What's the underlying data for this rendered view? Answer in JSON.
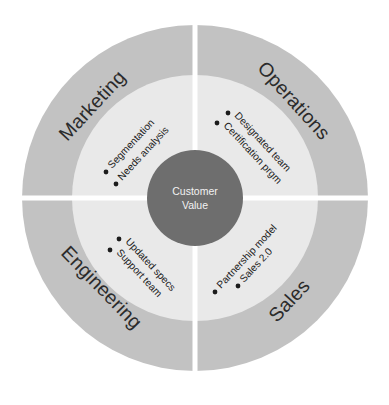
{
  "diagram": {
    "type": "concentric-quadrant-wheel",
    "center_label_line1": "Customer",
    "center_label_line2": "Value",
    "colors": {
      "background": "#ffffff",
      "outer_ring": "#c2c2c2",
      "inner_ring": "#e9e9e9",
      "hub": "#6e6e6e",
      "divider": "#ffffff",
      "label_text": "#2b2b2b",
      "hub_text": "#f2f2f2",
      "bullet_dot": "#1c1c1c"
    },
    "geometry": {
      "center_x": 195,
      "center_y": 198,
      "outer_radius": 173,
      "inner_ring_radius": 123,
      "hub_radius": 48,
      "divider_width": 5
    },
    "quadrants": [
      {
        "id": "marketing",
        "label": "Marketing",
        "position": "top-left",
        "items": [
          {
            "text": "Segmentation"
          },
          {
            "text": "Needs analysis"
          }
        ]
      },
      {
        "id": "operations",
        "label": "Operations",
        "position": "top-right",
        "items": [
          {
            "text": "Designated team"
          },
          {
            "text": "Certification prgm"
          }
        ]
      },
      {
        "id": "engineering",
        "label": "Engineering",
        "position": "bottom-left",
        "items": [
          {
            "text": "Updated specs"
          },
          {
            "text": "Support team"
          }
        ]
      },
      {
        "id": "sales",
        "label": "Sales",
        "position": "bottom-right",
        "items": [
          {
            "text": "Partnership model"
          },
          {
            "text": "Sales 2.0"
          }
        ]
      }
    ]
  }
}
